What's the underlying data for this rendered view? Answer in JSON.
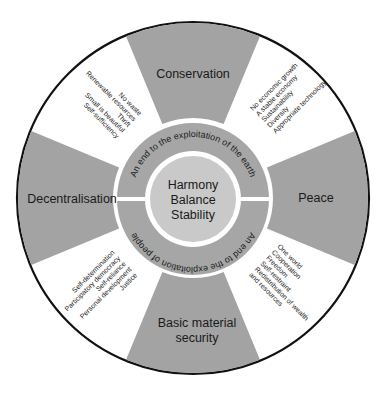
{
  "diagram": {
    "colors": {
      "wedge": "#a3a3a3",
      "ring": "#a6a6a6",
      "center": "#c9c9c9",
      "outline": "#111111",
      "background": "#ffffff"
    },
    "center": {
      "lines": [
        "Harmony",
        "Balance",
        "Stability"
      ]
    },
    "ring": {
      "top": "An end to the exploitation of the earth",
      "bottom": "An end to the exploitation of people"
    },
    "wedges": [
      {
        "id": "conservation",
        "lines": [
          "Conservation"
        ]
      },
      {
        "id": "peace",
        "lines": [
          "Peace"
        ]
      },
      {
        "id": "basic-material-security",
        "lines": [
          "Basic material",
          "security"
        ]
      },
      {
        "id": "decentralisation",
        "lines": [
          "Decentralisation"
        ]
      }
    ],
    "sectors": [
      {
        "id": "top-right",
        "items": [
          "No economic growth",
          "A stable economy",
          "Sustainability",
          "Diversity",
          "Appropriate technology"
        ]
      },
      {
        "id": "bottom-right",
        "items": [
          "One world",
          "Cooperation",
          "Freedom",
          "Self-restraint",
          "Redistribution of wealth",
          "and resources"
        ]
      },
      {
        "id": "bottom-left",
        "items": [
          "Self-determination",
          "Participatory democracy",
          "Self-reliance",
          "Personal development",
          "Justice"
        ]
      },
      {
        "id": "top-left",
        "items": [
          "No waste",
          "Renewable resources",
          "Thrift",
          "Small is beautiful",
          "Self-sufficiency"
        ]
      }
    ]
  }
}
